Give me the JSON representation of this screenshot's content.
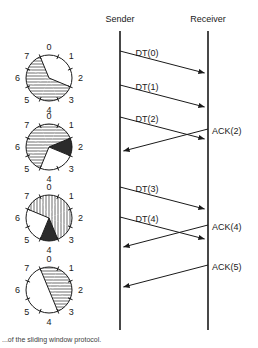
{
  "figure": {
    "caption": "...of the sliding window protocol."
  },
  "colors": {
    "line": "#1a1a1a",
    "hatch": "#7a7a7a",
    "solid_fill": "#2b2b2b",
    "empty_fill": "#ffffff",
    "background": "#ffffff"
  },
  "lifelines": [
    {
      "id": "sender",
      "label": "Sender",
      "x": 120,
      "top": 31,
      "bottom": 330
    },
    {
      "id": "receiver",
      "label": "Receiver",
      "x": 208,
      "top": 31,
      "bottom": 330
    }
  ],
  "messages": [
    {
      "label": "DT(0)",
      "from": "sender",
      "to": "receiver",
      "y_start": 51,
      "y_end": 73,
      "label_x": 147,
      "label_y": 56,
      "direction": "right"
    },
    {
      "label": "DT(1)",
      "from": "sender",
      "to": "receiver",
      "y_start": 85,
      "y_end": 107,
      "label_x": 147,
      "label_y": 90,
      "direction": "right"
    },
    {
      "label": "DT(2)",
      "from": "sender",
      "to": "receiver",
      "y_start": 117,
      "y_end": 139,
      "label_x": 147,
      "label_y": 122,
      "direction": "right"
    },
    {
      "label": "ACK(2)",
      "from": "receiver",
      "to": "sender",
      "y_start": 129,
      "y_end": 151,
      "label_x": 212,
      "label_y": 134,
      "direction": "left"
    },
    {
      "label": "DT(3)",
      "from": "sender",
      "to": "receiver",
      "y_start": 187,
      "y_end": 209,
      "label_x": 147,
      "label_y": 192,
      "direction": "right"
    },
    {
      "label": "DT(4)",
      "from": "sender",
      "to": "receiver",
      "y_start": 217,
      "y_end": 239,
      "label_x": 147,
      "label_y": 222,
      "direction": "right"
    },
    {
      "label": "ACK(4)",
      "from": "receiver",
      "to": "sender",
      "y_start": 225,
      "y_end": 247,
      "label_x": 212,
      "label_y": 230,
      "direction": "left"
    },
    {
      "label": "ACK(5)",
      "from": "receiver",
      "to": "sender",
      "y_start": 265,
      "y_end": 287,
      "label_x": 212,
      "label_y": 270,
      "direction": "left"
    }
  ],
  "window_wheels": [
    {
      "id": "wheel-1",
      "cx": 49,
      "cy": 78,
      "r": 23,
      "sector_labels": [
        "0",
        "1",
        "2",
        "3",
        "4",
        "5",
        "6",
        "7"
      ],
      "sectors": [
        {
          "index": 0,
          "state": "empty"
        },
        {
          "index": 1,
          "state": "empty"
        },
        {
          "index": 2,
          "state": "empty"
        },
        {
          "index": 3,
          "state": "hatch-h"
        },
        {
          "index": 4,
          "state": "hatch-h"
        },
        {
          "index": 5,
          "state": "hatch-h"
        },
        {
          "index": 6,
          "state": "hatch-h"
        },
        {
          "index": 7,
          "state": "hatch-h"
        }
      ]
    },
    {
      "id": "wheel-2",
      "cx": 49,
      "cy": 147,
      "r": 23,
      "sector_labels": [
        "0",
        "1",
        "2",
        "3",
        "4",
        "5",
        "6",
        "7"
      ],
      "sectors": [
        {
          "index": 0,
          "state": "hatch-h"
        },
        {
          "index": 1,
          "state": "hatch-h"
        },
        {
          "index": 2,
          "state": "solid"
        },
        {
          "index": 3,
          "state": "empty"
        },
        {
          "index": 4,
          "state": "empty"
        },
        {
          "index": 5,
          "state": "hatch-h"
        },
        {
          "index": 6,
          "state": "hatch-h"
        },
        {
          "index": 7,
          "state": "hatch-h"
        }
      ]
    },
    {
      "id": "wheel-3",
      "cx": 49,
      "cy": 218,
      "r": 23,
      "sector_labels": [
        "0",
        "1",
        "2",
        "3",
        "4",
        "5",
        "6",
        "7"
      ],
      "sectors": [
        {
          "index": 0,
          "state": "hatch-v"
        },
        {
          "index": 1,
          "state": "hatch-v"
        },
        {
          "index": 2,
          "state": "hatch-v"
        },
        {
          "index": 3,
          "state": "hatch-v"
        },
        {
          "index": 4,
          "state": "solid"
        },
        {
          "index": 5,
          "state": "empty"
        },
        {
          "index": 6,
          "state": "empty"
        },
        {
          "index": 7,
          "state": "hatch-v"
        }
      ]
    },
    {
      "id": "wheel-4",
      "cx": 49,
      "cy": 290,
      "r": 23,
      "sector_labels": [
        "0",
        "1",
        "2",
        "3",
        "4",
        "5",
        "6",
        "7"
      ],
      "sectors": [
        {
          "index": 0,
          "state": "hatch-h"
        },
        {
          "index": 1,
          "state": "hatch-h"
        },
        {
          "index": 2,
          "state": "hatch-h"
        },
        {
          "index": 3,
          "state": "hatch-h"
        },
        {
          "index": 4,
          "state": "empty"
        },
        {
          "index": 5,
          "state": "empty"
        },
        {
          "index": 6,
          "state": "empty"
        },
        {
          "index": 7,
          "state": "empty"
        }
      ]
    }
  ]
}
